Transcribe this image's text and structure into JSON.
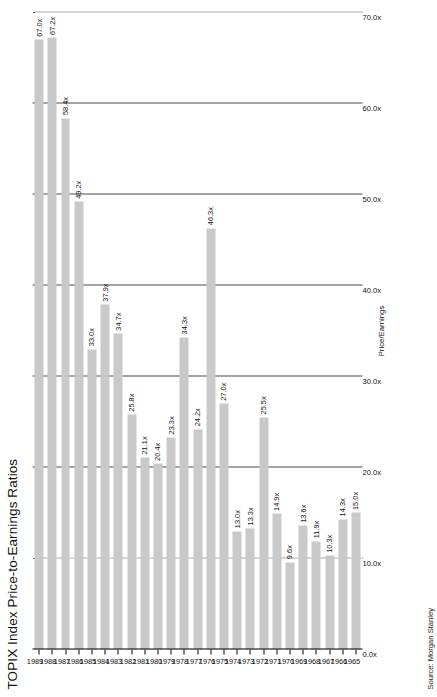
{
  "chart_data": {
    "type": "bar",
    "orientation": "horizontal",
    "title": "TOPIX Index Price-to-Earnings Ratios",
    "xlabel": "Price/Earnings",
    "ylabel": "",
    "source": "Source: Morgan Stanley",
    "grid": true,
    "legend": "none",
    "xlim": [
      0,
      70
    ],
    "tick_labels": [
      "70.0x",
      "60.0x",
      "50.0x",
      "40.0x",
      "30.0x",
      "20.0x",
      "10.0x",
      "0.0x"
    ],
    "tick_values": [
      70,
      60,
      50,
      40,
      30,
      20,
      10,
      0
    ],
    "value_suffix": "x",
    "categories": [
      "1989",
      "1988",
      "1987",
      "1986",
      "1985",
      "1984",
      "1983",
      "1982",
      "1981",
      "1980",
      "1979",
      "1978",
      "1977",
      "1976",
      "1975",
      "1974",
      "1973",
      "1972",
      "1971",
      "1970",
      "1969",
      "1968",
      "1967",
      "1966",
      "1965"
    ],
    "values": [
      67.0,
      67.2,
      58.4,
      49.2,
      33.0,
      37.9,
      34.7,
      25.8,
      21.1,
      20.4,
      23.3,
      34.3,
      24.2,
      46.3,
      27.0,
      13.0,
      13.3,
      25.5,
      14.9,
      9.6,
      13.6,
      11.9,
      10.3,
      14.3,
      15.0
    ],
    "data_labels": [
      "67.0x",
      "67.2x",
      "58.4x",
      "49.2x",
      "33.0x",
      "37.9x",
      "34.7x",
      "25.8x",
      "21.1x",
      "20.4x",
      "23.3x",
      "34.3x",
      "24.2x",
      "46.3x",
      "27.0x",
      "13.0x",
      "13.3x",
      "25.5x",
      "14.9x",
      "9.6x",
      "13.6x",
      "11.9x",
      "10.3x",
      "14.3x",
      "15.0x"
    ],
    "bar_color": "#c9c9c9",
    "axis_color": "#000000",
    "grid_color": "#4a4a4a"
  }
}
